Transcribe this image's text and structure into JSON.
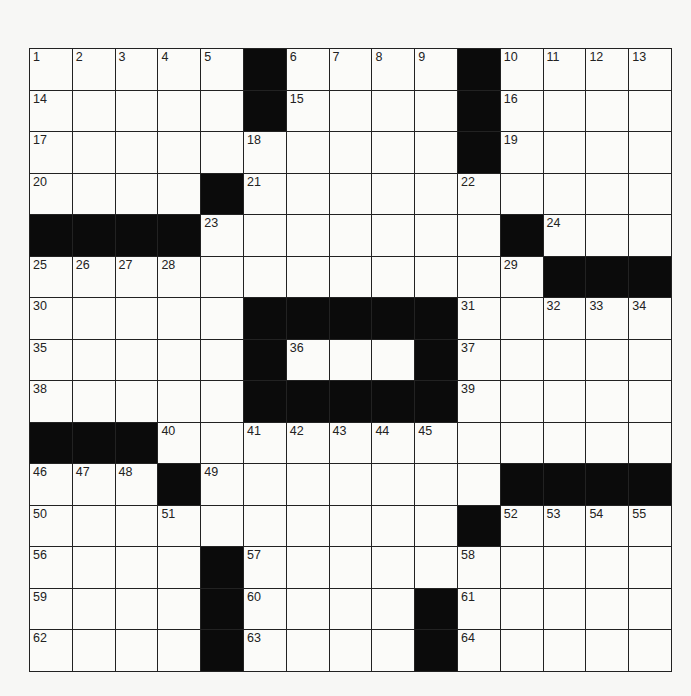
{
  "puzzle": {
    "rows": 15,
    "cols": 15,
    "colors": {
      "black": "#0b0b0b",
      "white": "#fbfbf9",
      "line": "#222222"
    },
    "layout": [
      "....._...._....",
      "....._...._....",
      ".........._....",
      "...._..........",
      "____......._...",
      "............___",
      "....._____.....",
      "....._..._.....",
      "....._____.....",
      "___............",
      "..._.......____",
      ".........._....",
      "...._..........",
      "...._...._.....",
      "...._...._....."
    ],
    "numbers": [
      [
        1,
        2,
        3,
        4,
        5,
        0,
        6,
        7,
        8,
        9,
        0,
        10,
        11,
        12,
        13
      ],
      [
        14,
        0,
        0,
        0,
        0,
        0,
        15,
        0,
        0,
        0,
        0,
        16,
        0,
        0,
        0
      ],
      [
        17,
        0,
        0,
        0,
        0,
        18,
        0,
        0,
        0,
        0,
        0,
        19,
        0,
        0,
        0
      ],
      [
        20,
        0,
        0,
        0,
        0,
        21,
        0,
        0,
        0,
        0,
        22,
        0,
        0,
        0,
        0
      ],
      [
        0,
        0,
        0,
        0,
        23,
        0,
        0,
        0,
        0,
        0,
        0,
        0,
        24,
        0,
        0
      ],
      [
        25,
        26,
        27,
        28,
        0,
        0,
        0,
        0,
        0,
        0,
        0,
        29,
        0,
        0,
        0
      ],
      [
        30,
        0,
        0,
        0,
        0,
        0,
        0,
        0,
        0,
        0,
        31,
        0,
        32,
        33,
        34
      ],
      [
        35,
        0,
        0,
        0,
        0,
        0,
        36,
        0,
        0,
        0,
        37,
        0,
        0,
        0,
        0
      ],
      [
        38,
        0,
        0,
        0,
        0,
        0,
        0,
        0,
        0,
        0,
        39,
        0,
        0,
        0,
        0
      ],
      [
        0,
        0,
        0,
        40,
        0,
        41,
        42,
        43,
        44,
        45,
        0,
        0,
        0,
        0,
        0
      ],
      [
        46,
        47,
        48,
        0,
        49,
        0,
        0,
        0,
        0,
        0,
        0,
        0,
        0,
        0,
        0
      ],
      [
        50,
        0,
        0,
        51,
        0,
        0,
        0,
        0,
        0,
        0,
        0,
        52,
        53,
        54,
        55
      ],
      [
        56,
        0,
        0,
        0,
        0,
        57,
        0,
        0,
        0,
        0,
        58,
        0,
        0,
        0,
        0
      ],
      [
        59,
        0,
        0,
        0,
        0,
        60,
        0,
        0,
        0,
        0,
        61,
        0,
        0,
        0,
        0
      ],
      [
        62,
        0,
        0,
        0,
        0,
        63,
        0,
        0,
        0,
        0,
        64,
        0,
        0,
        0,
        0
      ]
    ]
  }
}
